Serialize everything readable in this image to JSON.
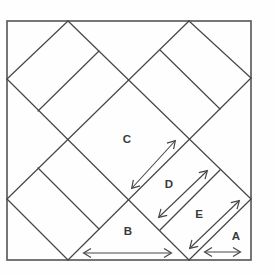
{
  "figure": {
    "canvas": {
      "width": 276,
      "height": 274,
      "background": "#fefefe"
    },
    "colors": {
      "square_stroke": "#5f5f5f",
      "line_stroke": "#464646",
      "label_color": "#3a3a3a"
    },
    "square": {
      "x": 7,
      "y": 21,
      "width": 244,
      "height": 239
    },
    "labels": [
      {
        "name": "label-a",
        "text": "A",
        "x": 236,
        "y": 240
      },
      {
        "name": "label-b",
        "text": "B",
        "x": 128,
        "y": 235
      },
      {
        "name": "label-c",
        "text": "C",
        "x": 127,
        "y": 143
      },
      {
        "name": "label-d",
        "text": "D",
        "x": 169,
        "y": 188
      },
      {
        "name": "label-e",
        "text": "E",
        "x": 199,
        "y": 218
      }
    ],
    "lines": [
      {
        "name": "corner-cut-nw-line",
        "points": [
          68,
          21,
          7,
          79
        ]
      },
      {
        "name": "long-diagonal-ne-line",
        "points": [
          7,
          199,
          189,
          21
        ]
      },
      {
        "name": "long-diagonal-se-line",
        "points": [
          68,
          260,
          251,
          78
        ]
      },
      {
        "name": "corner-cut-se-line",
        "points": [
          189,
          260,
          251,
          199
        ]
      },
      {
        "name": "corner-cut-ne-line",
        "points": [
          189,
          21,
          251,
          78
        ]
      },
      {
        "name": "long-diagonal-sw-line",
        "points": [
          68,
          21,
          251,
          199
        ]
      },
      {
        "name": "long-diagonal-nw-line",
        "points": [
          7,
          79,
          189,
          260
        ]
      },
      {
        "name": "corner-cut-sw-line",
        "points": [
          7,
          199,
          68,
          260
        ]
      },
      {
        "name": "nw-diamond-divider-line",
        "points": [
          38,
          111,
          99,
          51
        ]
      },
      {
        "name": "ne-diamond-divider-line",
        "points": [
          160,
          50,
          220,
          109
        ]
      },
      {
        "name": "sw-diamond-divider-line",
        "points": [
          38,
          168,
          99,
          229
        ]
      },
      {
        "name": "se-diamond-divider-line",
        "points": [
          160,
          230,
          220,
          170
        ]
      }
    ],
    "arrows": [
      {
        "name": "c-length-arrow",
        "points": [
          132,
          188,
          175,
          141
        ]
      },
      {
        "name": "d-length-arrow",
        "points": [
          159,
          217,
          207,
          171
        ]
      },
      {
        "name": "e-length-arrow",
        "points": [
          190,
          248,
          239,
          201
        ]
      },
      {
        "name": "b-length-arrow",
        "points": [
          84,
          253,
          171,
          253
        ]
      },
      {
        "name": "a-length-arrow",
        "points": [
          205,
          252,
          240,
          252
        ]
      }
    ]
  }
}
